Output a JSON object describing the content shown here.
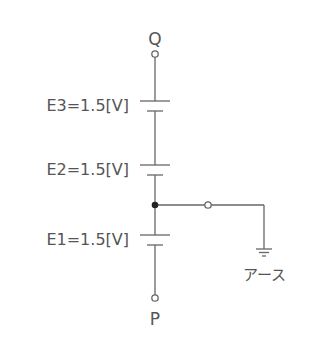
{
  "diagram": {
    "type": "circuit",
    "terminals": {
      "top": "Q",
      "bottom": "P"
    },
    "batteries": [
      {
        "name": "E3",
        "label": "E3=1.5[V]",
        "voltage": 1.5,
        "unit": "V"
      },
      {
        "name": "E2",
        "label": "E2=1.5[V]",
        "voltage": 1.5,
        "unit": "V"
      },
      {
        "name": "E1",
        "label": "E1=1.5[V]",
        "voltage": 1.5,
        "unit": "V"
      }
    ],
    "ground_label": "アース",
    "colors": {
      "line": "#666666",
      "text": "#555555",
      "junction": "#222222"
    }
  }
}
